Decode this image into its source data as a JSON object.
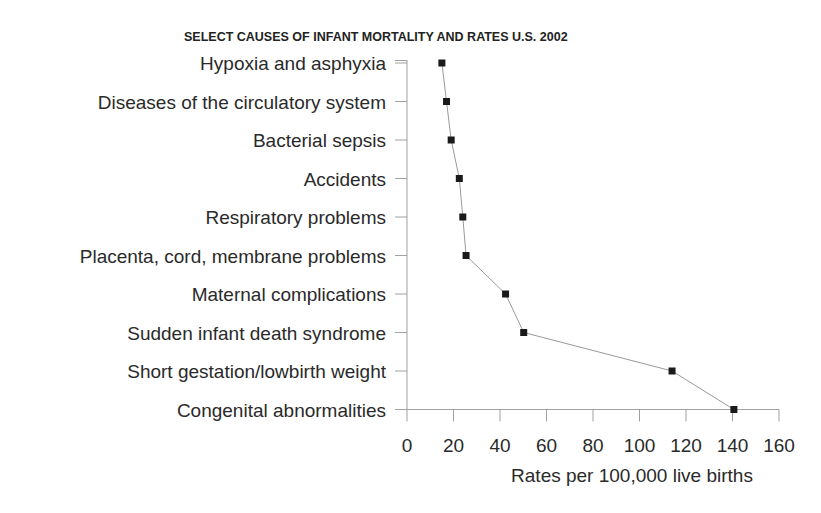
{
  "chart_data": {
    "type": "line",
    "orientation": "horizontal-categories-on-y",
    "title": "SELECT CAUSES OF INFANT MORTALITY AND RATES U.S. 2002",
    "xlabel": "Rates per 100,000 live births",
    "ylabel": "",
    "xlim": [
      0,
      160
    ],
    "x_ticks": [
      0,
      20,
      40,
      60,
      80,
      100,
      120,
      140,
      160
    ],
    "grid": false,
    "legend": null,
    "categories": [
      "Hypoxia and asphyxia",
      "Diseases of the circulatory system",
      "Bacterial sepsis",
      "Accidents",
      "Respiratory problems",
      "Placenta, cord, membrane problems",
      "Maternal complications",
      "Sudden infant death syndrome",
      "Short gestation/lowbirth weight",
      "Congenital abnormalities"
    ],
    "series": [
      {
        "name": "Rate",
        "marker": "square",
        "values": [
          15,
          17,
          19,
          22.5,
          24,
          25.4,
          42.4,
          50.2,
          114,
          140.6
        ]
      }
    ]
  },
  "colors": {
    "marker": "#1a1a1a",
    "line": "#9a9a9a",
    "axis": "#a0a0a0",
    "text": "#2a2a2a"
  }
}
